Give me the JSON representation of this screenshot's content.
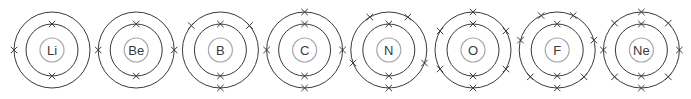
{
  "diagram": {
    "electron_marker": "cross",
    "atoms": [
      {
        "symbol": "Li",
        "shells": [
          {
            "electrons": 2,
            "angles": [
              90,
              270
            ]
          },
          {
            "electrons": 1,
            "angles": [
              180
            ]
          }
        ]
      },
      {
        "symbol": "Be",
        "shells": [
          {
            "electrons": 2,
            "angles": [
              90,
              270
            ]
          },
          {
            "electrons": 2,
            "angles": [
              180,
              0
            ]
          }
        ]
      },
      {
        "symbol": "B",
        "shells": [
          {
            "electrons": 2,
            "angles": [
              90,
              270
            ]
          },
          {
            "electrons": 3,
            "angles": [
              140,
              40,
              270
            ]
          }
        ]
      },
      {
        "symbol": "C",
        "shells": [
          {
            "electrons": 2,
            "angles": [
              90,
              270
            ]
          },
          {
            "electrons": 4,
            "angles": [
              90,
              270,
              180,
              0
            ]
          }
        ]
      },
      {
        "symbol": "N",
        "shells": [
          {
            "electrons": 2,
            "angles": [
              90,
              270
            ]
          },
          {
            "electrons": 5,
            "angles": [
              120,
              60,
              200,
              340,
              270
            ]
          }
        ]
      },
      {
        "symbol": "O",
        "shells": [
          {
            "electrons": 2,
            "angles": [
              90,
              270
            ]
          },
          {
            "electrons": 6,
            "angles": [
              90,
              270,
              150,
              210,
              30,
              330
            ]
          }
        ]
      },
      {
        "symbol": "F",
        "shells": [
          {
            "electrons": 2,
            "angles": [
              90,
              270
            ]
          },
          {
            "electrons": 7,
            "angles": [
              115,
              65,
              165,
              15,
              225,
              315,
              270
            ]
          }
        ]
      },
      {
        "symbol": "Ne",
        "shells": [
          {
            "electrons": 2,
            "angles": [
              90,
              270
            ]
          },
          {
            "electrons": 8,
            "angles": [
              90,
              270,
              0,
              180,
              45,
              135,
              225,
              315
            ]
          }
        ]
      }
    ]
  }
}
